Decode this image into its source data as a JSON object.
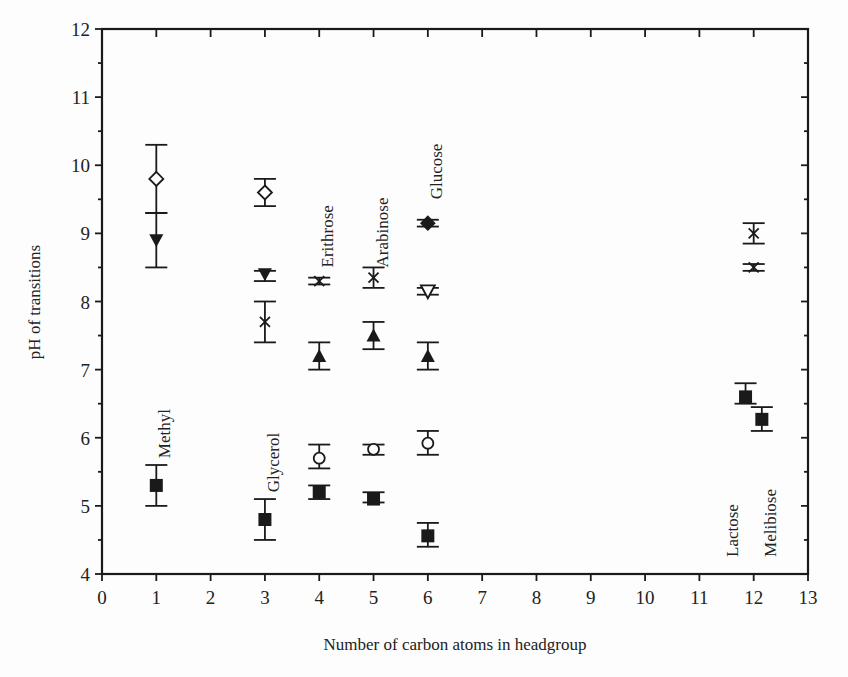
{
  "chart_data": {
    "type": "scatter",
    "title": "",
    "xlabel": "Number of carbon atoms in headgroup",
    "ylabel": "pH of transitions",
    "xlim": [
      0,
      13
    ],
    "ylim": [
      4,
      12
    ],
    "xticks": [
      0,
      1,
      2,
      3,
      4,
      5,
      6,
      7,
      8,
      9,
      10,
      11,
      12,
      13
    ],
    "yticks": [
      4,
      5,
      6,
      7,
      8,
      9,
      10,
      11,
      12
    ],
    "y_minor_step": 0.5,
    "grid": false,
    "legend": null,
    "series": [
      {
        "name": "open-diamond",
        "marker": "diamond-open",
        "points": [
          {
            "x": 1,
            "y": 9.8,
            "err_lo": 9.3,
            "err_hi": 10.3
          },
          {
            "x": 3,
            "y": 9.6,
            "err_lo": 9.4,
            "err_hi": 9.8
          }
        ]
      },
      {
        "name": "filled-triangle-down",
        "marker": "triangle-down-filled",
        "points": [
          {
            "x": 1,
            "y": 8.9,
            "err_lo": 8.5,
            "err_hi": 9.3
          },
          {
            "x": 3,
            "y": 8.4,
            "err_lo": 8.3,
            "err_hi": 8.45
          }
        ]
      },
      {
        "name": "cross",
        "marker": "x",
        "points": [
          {
            "x": 3,
            "y": 7.7,
            "err_lo": 7.4,
            "err_hi": 8.0
          },
          {
            "x": 4,
            "y": 8.3,
            "err_lo": 8.25,
            "err_hi": 8.35
          },
          {
            "x": 5,
            "y": 8.35,
            "err_lo": 8.2,
            "err_hi": 8.5
          },
          {
            "x": 12,
            "y": 9.0,
            "err_lo": 8.85,
            "err_hi": 9.15
          },
          {
            "x": 12,
            "y": 8.5,
            "err_lo": 8.45,
            "err_hi": 8.55
          }
        ]
      },
      {
        "name": "filled-triangle-up",
        "marker": "triangle-up-filled",
        "points": [
          {
            "x": 4,
            "y": 7.2,
            "err_lo": 7.0,
            "err_hi": 7.4
          },
          {
            "x": 5,
            "y": 7.5,
            "err_lo": 7.3,
            "err_hi": 7.7
          },
          {
            "x": 6,
            "y": 7.2,
            "err_lo": 7.0,
            "err_hi": 7.4
          }
        ]
      },
      {
        "name": "open-circle",
        "marker": "circle-open",
        "points": [
          {
            "x": 4,
            "y": 5.7,
            "err_lo": 5.55,
            "err_hi": 5.9
          },
          {
            "x": 5,
            "y": 5.83,
            "err_lo": 5.75,
            "err_hi": 5.9
          },
          {
            "x": 6,
            "y": 5.92,
            "err_lo": 5.75,
            "err_hi": 6.1
          }
        ]
      },
      {
        "name": "filled-square",
        "marker": "square-filled",
        "points": [
          {
            "x": 1,
            "y": 5.3,
            "err_lo": 5.0,
            "err_hi": 5.6
          },
          {
            "x": 3,
            "y": 4.8,
            "err_lo": 4.5,
            "err_hi": 5.1
          },
          {
            "x": 4,
            "y": 5.2,
            "err_lo": 5.1,
            "err_hi": 5.3
          },
          {
            "x": 5,
            "y": 5.1,
            "err_lo": 5.05,
            "err_hi": 5.2
          },
          {
            "x": 6,
            "y": 4.56,
            "err_lo": 4.4,
            "err_hi": 4.75
          },
          {
            "x": 11.85,
            "y": 6.6,
            "err_lo": 6.5,
            "err_hi": 6.8
          },
          {
            "x": 12.15,
            "y": 6.27,
            "err_lo": 6.1,
            "err_hi": 6.45
          }
        ]
      },
      {
        "name": "filled-diamond",
        "marker": "diamond-filled",
        "points": [
          {
            "x": 6,
            "y": 9.15,
            "err_lo": 9.1,
            "err_hi": 9.2
          }
        ]
      },
      {
        "name": "open-triangle-down",
        "marker": "triangle-down-open",
        "points": [
          {
            "x": 6,
            "y": 8.15,
            "err_lo": 8.1,
            "err_hi": 8.2
          }
        ]
      }
    ],
    "annotations": [
      {
        "text": "Methyl",
        "x": 1.15,
        "y": 5.7,
        "rotation": -90
      },
      {
        "text": "Glycerol",
        "x": 3.15,
        "y": 5.2,
        "rotation": -90
      },
      {
        "text": "Erithrose",
        "x": 4.15,
        "y": 8.5,
        "rotation": -90
      },
      {
        "text": "Arabinose",
        "x": 5.15,
        "y": 8.5,
        "rotation": -90
      },
      {
        "text": "Glucose",
        "x": 6.15,
        "y": 9.5,
        "rotation": -90
      },
      {
        "text": "Lactose",
        "x": 11.6,
        "y": 4.25,
        "rotation": -90
      },
      {
        "text": "Melibiose",
        "x": 12.3,
        "y": 4.25,
        "rotation": -90
      }
    ]
  },
  "colors": {
    "ink": "#1a1a1a",
    "background": "#fdfdfd"
  }
}
